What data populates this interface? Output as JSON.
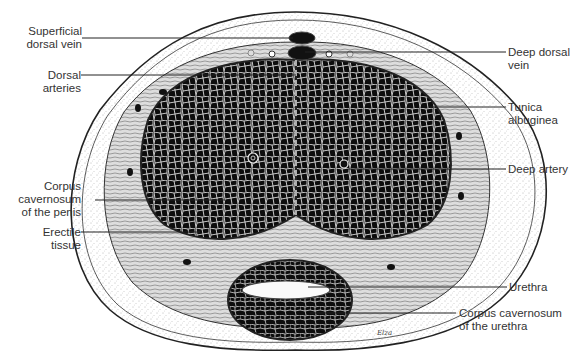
{
  "diagram": {
    "signature": "Elza",
    "labels": [
      {
        "id": "superficial-dorsal-vein",
        "lines": [
          "Superficial",
          "dorsal vein"
        ],
        "side": "left"
      },
      {
        "id": "dorsal-arteries",
        "lines": [
          "Dorsal",
          "arteries"
        ],
        "side": "left"
      },
      {
        "id": "corpus-cavernosum-penis",
        "lines": [
          "Corpus",
          "cavernosum",
          "of the penis"
        ],
        "side": "left"
      },
      {
        "id": "erectile-tissue",
        "lines": [
          "Erectile",
          "tissue"
        ],
        "side": "left"
      },
      {
        "id": "deep-dorsal-vein",
        "lines": [
          "Deep dorsal",
          "vein"
        ],
        "side": "right"
      },
      {
        "id": "tunica-albuginea",
        "lines": [
          "Tunica",
          "albuginea"
        ],
        "side": "right"
      },
      {
        "id": "deep-artery",
        "lines": [
          "Deep artery"
        ],
        "side": "right"
      },
      {
        "id": "urethra",
        "lines": [
          "Urethra"
        ],
        "side": "right"
      },
      {
        "id": "corpus-cavernosum-urethra",
        "lines": [
          "Corpus cavernosum",
          "of the urethra"
        ],
        "side": "right"
      }
    ],
    "colors": {
      "ink": "#111111",
      "paper": "#ffffff",
      "text": "#333333",
      "stipple": "#888888"
    }
  }
}
